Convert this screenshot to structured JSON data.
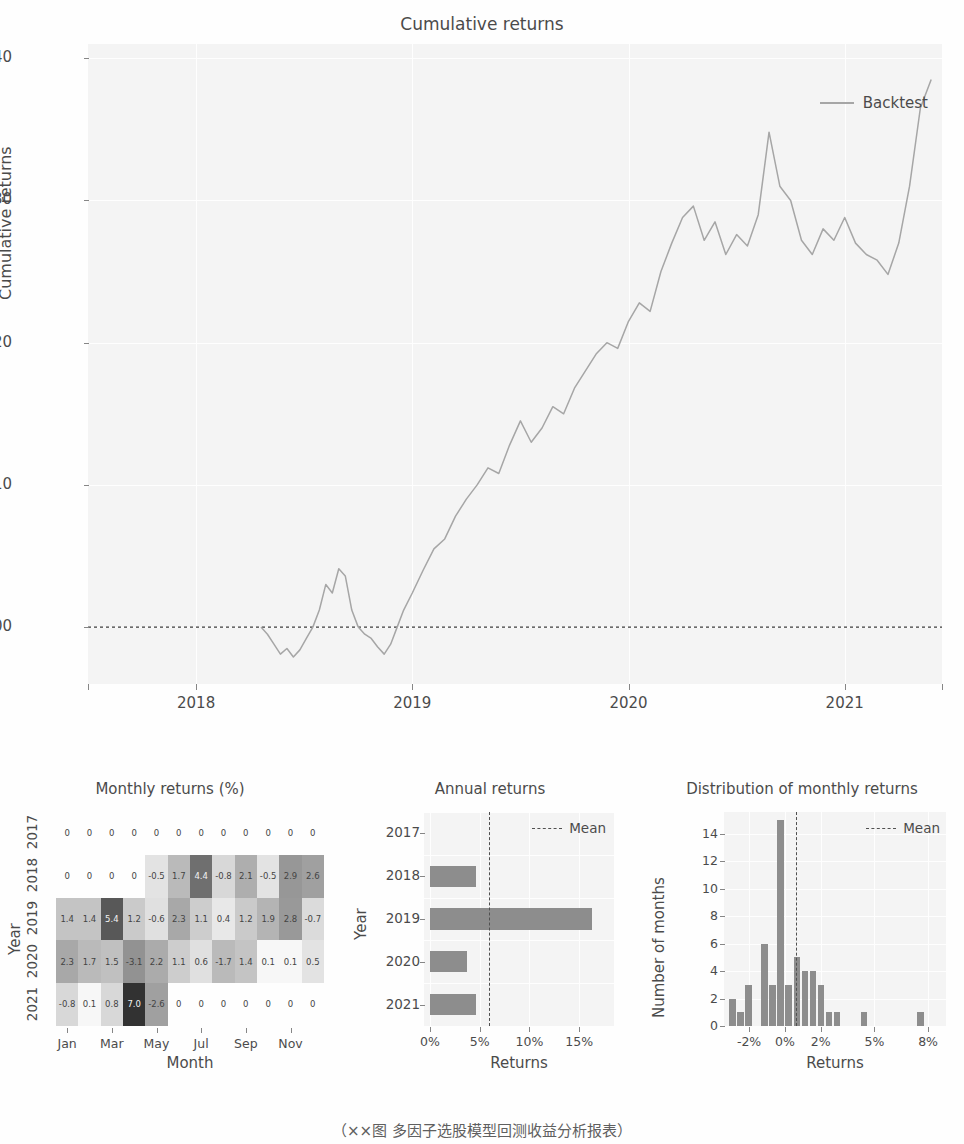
{
  "caption": "（××图 多因子选股模型回测收益分析报表）",
  "colors": {
    "line": "#9b9b9b",
    "bar": "#7f7f7f",
    "mean_line": "#3a3a3a",
    "plot_bg": "#f4f4f4",
    "grid": "#ffffff",
    "text": "#333333"
  },
  "chart_data": [
    {
      "type": "line",
      "title": "Cumulative returns",
      "xlabel": "",
      "ylabel": "Cumulative returns",
      "ylim": [
        0.96,
        1.41
      ],
      "yticks": [
        "1.00",
        "1.10",
        "1.20",
        "1.30",
        "1.40"
      ],
      "ytick_values": [
        1.0,
        1.1,
        1.2,
        1.3,
        1.4
      ],
      "xticks": [
        "2018",
        "2019",
        "2020",
        "2021"
      ],
      "xtick_values": [
        2018,
        2019,
        2020,
        2021
      ],
      "xlim": [
        2017.5,
        2021.45
      ],
      "grid": true,
      "legend": [
        "Backtest"
      ],
      "legend_position": "upper right",
      "baseline": 1.0,
      "series": [
        {
          "name": "Backtest",
          "x": [
            2018.3,
            2018.33,
            2018.36,
            2018.39,
            2018.42,
            2018.45,
            2018.48,
            2018.51,
            2018.54,
            2018.57,
            2018.6,
            2018.63,
            2018.66,
            2018.69,
            2018.72,
            2018.75,
            2018.78,
            2018.81,
            2018.84,
            2018.87,
            2018.9,
            2018.93,
            2018.96,
            2019.0,
            2019.05,
            2019.1,
            2019.15,
            2019.2,
            2019.25,
            2019.3,
            2019.35,
            2019.4,
            2019.45,
            2019.5,
            2019.55,
            2019.6,
            2019.65,
            2019.7,
            2019.75,
            2019.8,
            2019.85,
            2019.9,
            2019.95,
            2020.0,
            2020.05,
            2020.1,
            2020.15,
            2020.2,
            2020.25,
            2020.3,
            2020.35,
            2020.4,
            2020.45,
            2020.5,
            2020.55,
            2020.6,
            2020.65,
            2020.7,
            2020.75,
            2020.8,
            2020.85,
            2020.9,
            2020.95,
            2021.0,
            2021.05,
            2021.1,
            2021.15,
            2021.2,
            2021.25,
            2021.3,
            2021.35,
            2021.4
          ],
          "y": [
            1.0,
            0.995,
            0.988,
            0.981,
            0.985,
            0.979,
            0.984,
            0.992,
            1.0,
            1.012,
            1.03,
            1.024,
            1.041,
            1.036,
            1.012,
            1.0,
            0.995,
            0.992,
            0.986,
            0.981,
            0.988,
            1.0,
            1.012,
            1.024,
            1.04,
            1.055,
            1.062,
            1.078,
            1.09,
            1.1,
            1.112,
            1.108,
            1.128,
            1.145,
            1.13,
            1.14,
            1.155,
            1.15,
            1.168,
            1.18,
            1.192,
            1.2,
            1.196,
            1.215,
            1.228,
            1.222,
            1.25,
            1.27,
            1.288,
            1.296,
            1.272,
            1.285,
            1.262,
            1.276,
            1.268,
            1.29,
            1.348,
            1.31,
            1.3,
            1.272,
            1.262,
            1.28,
            1.272,
            1.288,
            1.27,
            1.262,
            1.258,
            1.248,
            1.27,
            1.31,
            1.365,
            1.385
          ]
        }
      ]
    },
    {
      "type": "heatmap",
      "title": "Monthly returns (%)",
      "xlabel": "Month",
      "ylabel": "Year",
      "xticks": [
        "Jan",
        "Mar",
        "May",
        "Jul",
        "Sep",
        "Nov"
      ],
      "xtick_indices": [
        0,
        2,
        4,
        6,
        8,
        10
      ],
      "columns": [
        "Jan",
        "Feb",
        "Mar",
        "Apr",
        "May",
        "Jun",
        "Jul",
        "Aug",
        "Sep",
        "Oct",
        "Nov",
        "Dec"
      ],
      "rows": [
        "2017",
        "2018",
        "2019",
        "2020",
        "2021"
      ],
      "values": [
        [
          0,
          0,
          0,
          0,
          0,
          0,
          0,
          0,
          0,
          0,
          0,
          0
        ],
        [
          0,
          0,
          0,
          0,
          -0.5,
          1.7,
          4.4,
          -0.8,
          2.1,
          -0.5,
          2.9,
          2.6
        ],
        [
          1.4,
          1.4,
          5.4,
          1.2,
          -0.6,
          2.3,
          1.1,
          0.4,
          1.2,
          1.9,
          2.8,
          -0.7
        ],
        [
          2.3,
          1.7,
          1.5,
          -3.1,
          2.2,
          1.1,
          0.6,
          -1.7,
          1.4,
          0.1,
          0.1,
          0.5
        ],
        [
          -0.8,
          0.1,
          0.8,
          7.0,
          -2.6,
          0,
          0,
          0,
          0,
          0,
          0,
          0
        ]
      ],
      "vmin": -3.1,
      "vmax": 7.0
    },
    {
      "type": "bar",
      "orientation": "horizontal",
      "title": "Annual returns",
      "xlabel": "Returns",
      "ylabel": "Year",
      "categories": [
        "2017",
        "2018",
        "2019",
        "2020",
        "2021"
      ],
      "values": [
        0.0,
        4.6,
        16.3,
        3.7,
        4.6
      ],
      "xticks": [
        "0%",
        "5%",
        "10%",
        "15%"
      ],
      "xtick_values": [
        0,
        5,
        10,
        15
      ],
      "xlim": [
        -0.6,
        18.5
      ],
      "mean": 5.9,
      "legend": [
        "Mean"
      ],
      "grid": true
    },
    {
      "type": "bar",
      "subtype": "histogram",
      "title": "Distribution of monthly returns",
      "xlabel": "Returns",
      "ylabel": "Number of months",
      "yticks": [
        "0",
        "2",
        "4",
        "6",
        "8",
        "10",
        "12",
        "14"
      ],
      "ytick_values": [
        0,
        2,
        4,
        6,
        8,
        10,
        12,
        14
      ],
      "ylim": [
        0,
        15.6
      ],
      "xticks": [
        "-2%",
        "0%",
        "2%",
        "5%",
        "8%"
      ],
      "xtick_values": [
        -2,
        0,
        2,
        5,
        8
      ],
      "xlim": [
        -3.4,
        9.0
      ],
      "bin_centers": [
        -2.9,
        -2.45,
        -2.0,
        -1.1,
        -0.65,
        -0.2,
        0.25,
        0.7,
        1.15,
        1.6,
        2.05,
        2.5,
        2.95,
        4.45,
        7.6
      ],
      "bin_width": 0.43,
      "values": [
        2,
        1,
        3,
        6,
        3,
        15,
        3,
        5,
        4,
        4,
        3,
        1,
        1,
        1,
        1
      ],
      "mean": 0.62,
      "legend": [
        "Mean"
      ],
      "grid": true
    }
  ]
}
